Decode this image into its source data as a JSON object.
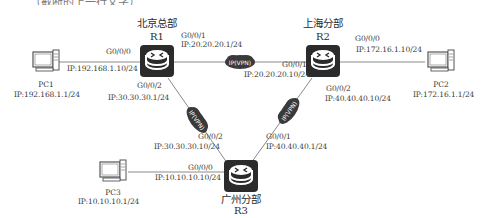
{
  "top_fragment": "（截断的上一行文字）",
  "sites": {
    "r1": {
      "site": "北京总部",
      "name": "R1"
    },
    "r2": {
      "site": "上海分部",
      "name": "R2"
    },
    "r3": {
      "site": "广州分部",
      "name": "R3"
    }
  },
  "pcs": {
    "pc1": {
      "name": "PC1",
      "ip": "IP:192.168.1.1/24"
    },
    "pc2": {
      "name": "PC2",
      "ip": "IP:172.16.1.1/24"
    },
    "pc3": {
      "name": "PC3",
      "ip": "IP:10.10.10.1/24"
    }
  },
  "interfaces": {
    "r1_g000": {
      "port": "G0/0/0",
      "ip": "IP:192.168.1.10/24"
    },
    "r1_g001": {
      "port": "G0/0/1",
      "ip": "IP:20.20.20.1/24"
    },
    "r1_g002": {
      "port": "G0/0/2",
      "ip": "IP:30.30.30.1/24"
    },
    "r2_g000": {
      "port": "G0/0/0",
      "ip": "IP:172.16.1.10/24"
    },
    "r2_g001": {
      "port": "G0/0/1",
      "ip": "IP:20.20.20.10/24"
    },
    "r2_g002": {
      "port": "G0/0/2",
      "ip": "IP:40.40.40.10/24"
    },
    "r3_g000": {
      "port": "G0/0/0",
      "ip": "IP:10.10.10.10/24"
    },
    "r3_g001": {
      "port": "G0/0/1",
      "ip": "IP:40.40.40.1/24"
    },
    "r3_g002": {
      "port": "G0/0/2",
      "ip": "IP:30.30.30.10/24"
    }
  },
  "clouds": {
    "r1_r2": "IP(VPN)",
    "r1_r3": "IP(VPN)",
    "r2_r3": "IP(VPN)"
  },
  "colors": {
    "router_fill": "#2b2b2b",
    "cloud_fill": "#3a3a3a",
    "link": "#8a8a8a",
    "text": "#3a3a3a"
  }
}
